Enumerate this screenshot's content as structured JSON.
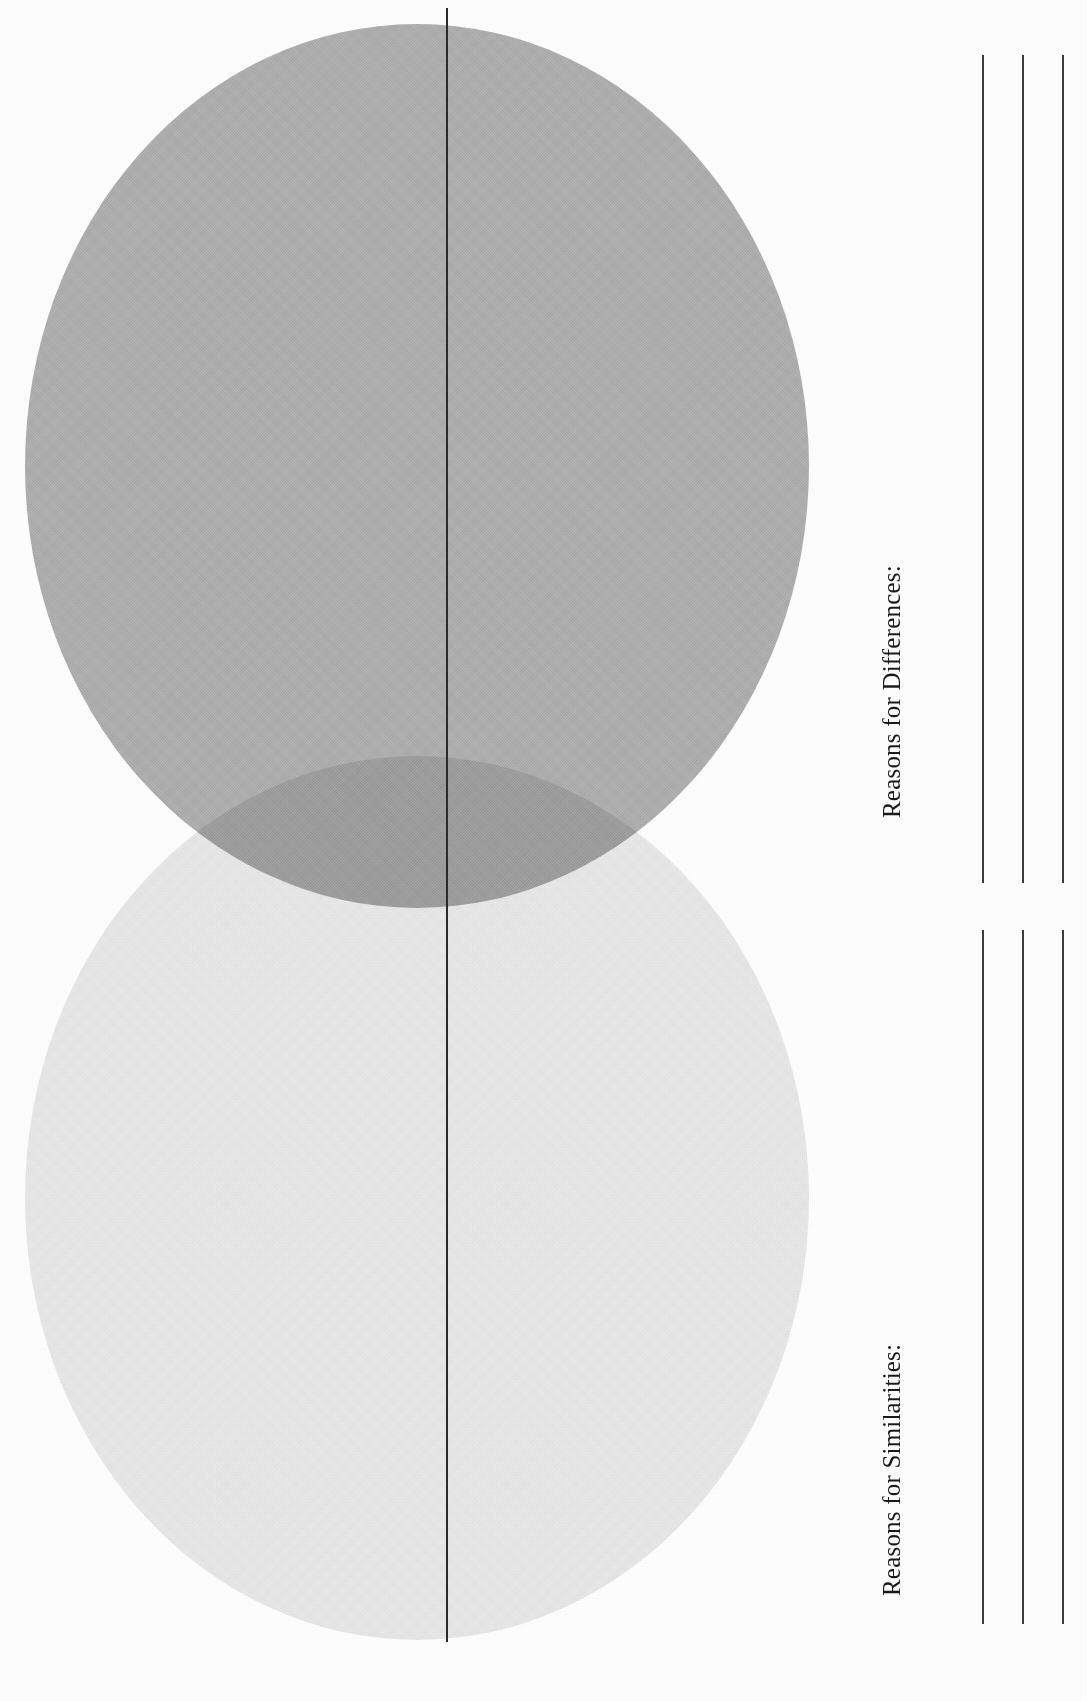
{
  "page": {
    "width": 1087,
    "height": 1701,
    "background_color": "#fefefe",
    "orientation": "landscape-text-rotated"
  },
  "venn": {
    "name": "two-circle-venn-diagram",
    "divider_color": "#2b2b2b",
    "circles": [
      {
        "id": "top-circle",
        "label": "",
        "fill_color": "#b6b6b6",
        "position": "top",
        "shading": "medium-gray-halftone"
      },
      {
        "id": "bottom-circle",
        "label": "",
        "fill_color": "#ececec",
        "position": "bottom",
        "shading": "light-gray-halftone"
      }
    ],
    "overlap": {
      "label": "",
      "fill_color": "#a4a4a4",
      "shading": "dark-gray-halftone"
    }
  },
  "writing_panel": {
    "sections": [
      {
        "id": "differences",
        "label": "Reasons for Differences:",
        "line_count": 3,
        "line_color": "#3a3a3a"
      },
      {
        "id": "similarities",
        "label": "Reasons for Similarities:",
        "line_count": 3,
        "line_color": "#3a3a3a"
      }
    ]
  }
}
